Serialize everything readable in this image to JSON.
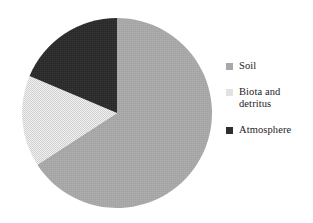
{
  "figure": {
    "background_color": "#ffffff",
    "text_color": "#1c1c1c"
  },
  "chart_data": {
    "type": "pie",
    "title": "",
    "subtitle": "",
    "xlabel": "",
    "ylabel": "",
    "grid": false,
    "legend_position": "right",
    "start_angle_deg": 0,
    "direction": "clockwise",
    "center": {
      "x": 117,
      "y": 113
    },
    "radius": 95,
    "categories": [
      "Soil",
      "Biota and detritus",
      "Atmosphere"
    ],
    "values": [
      66,
      15,
      19
    ],
    "value_unit": "percent",
    "slices": [
      {
        "label": "Soil",
        "value": 66,
        "start_angle_deg": 0,
        "end_angle_deg": 237,
        "color": "#a8a8a8",
        "fill_style": "solid"
      },
      {
        "label": "Biota and detritus",
        "value": 15,
        "start_angle_deg": 237,
        "end_angle_deg": 293,
        "color": "#e2e2e2",
        "fill_style": "dithered"
      },
      {
        "label": "Atmosphere",
        "value": 19,
        "start_angle_deg": 293,
        "end_angle_deg": 360,
        "color": "#2e2e2e",
        "fill_style": "solid"
      }
    ]
  },
  "legend": {
    "entries": [
      {
        "label": "Soil",
        "color": "#a8a8a8",
        "swatch_name": "legend-swatch-soil"
      },
      {
        "label": "Biota and\ndetritus",
        "color": "#e2e2e2",
        "swatch_name": "legend-swatch-biota-and-detritus"
      },
      {
        "label": "Atmosphere",
        "color": "#2e2e2e",
        "swatch_name": "legend-swatch-atmosphere"
      }
    ]
  }
}
